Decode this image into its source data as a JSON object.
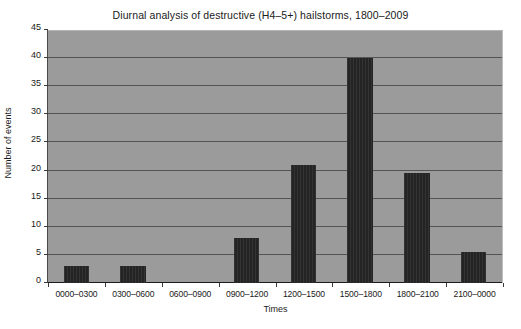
{
  "chart_data": {
    "type": "bar",
    "title": "Diurnal analysis of destructive (H4–5+) hailstorms, 1800–2009",
    "xlabel": "Times",
    "ylabel": "Number of events",
    "categories": [
      "0000–0300",
      "0300–0600",
      "0600–0900",
      "0900–1200",
      "1200–1500",
      "1500–1800",
      "1800–2100",
      "2100–0000"
    ],
    "values": [
      3,
      3,
      0,
      8,
      21,
      40,
      19.5,
      5.5
    ],
    "ylim": [
      0,
      45
    ],
    "ytick_labels": [
      "0",
      "5",
      "10",
      "15",
      "20",
      "25",
      "30",
      "35",
      "40",
      "45"
    ],
    "ytick_values": [
      0,
      5,
      10,
      15,
      20,
      25,
      30,
      35,
      40,
      45
    ],
    "grid": true,
    "legend": false,
    "colors": {
      "bar": "#242424",
      "plot_background": "#9b9b9b",
      "gridline": "#3c3c3c",
      "figure_background": "#ffffff",
      "text": "#1a1a1a"
    }
  }
}
